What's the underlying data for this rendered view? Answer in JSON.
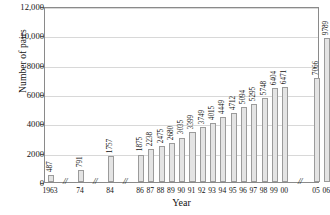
{
  "chart_data": {
    "type": "bar",
    "title": "",
    "xlabel": "Year",
    "ylabel": "Number of pairs",
    "ylim": [
      0,
      12000
    ],
    "grid": true,
    "legend": null,
    "axis_breaks": [
      "between 1963 and 74",
      "between 74 and 84",
      "between 84 and 86",
      "between 00 and 05"
    ],
    "ytick_labels": [
      "0",
      "2000",
      "4000",
      "6000",
      "8000",
      "10,000",
      "12,000"
    ],
    "ytick_values": [
      0,
      2000,
      4000,
      6000,
      8000,
      10000,
      12000
    ],
    "categories": [
      "1963",
      "74",
      "84",
      "86",
      "87",
      "88",
      "89",
      "90",
      "91",
      "92",
      "93",
      "94",
      "95",
      "96",
      "97",
      "98",
      "99",
      "00",
      "05",
      "06"
    ],
    "values": [
      487,
      791,
      1757,
      1875,
      2238,
      2475,
      2680,
      3035,
      3399,
      3749,
      4015,
      4449,
      4712,
      5094,
      5295,
      5748,
      6404,
      6471,
      7066,
      9789
    ],
    "value_labels": [
      "487",
      "791",
      "1757",
      "1875",
      "2238",
      "2475",
      "2680",
      "3035",
      "3399",
      "3749",
      "4015",
      "4449",
      "4712",
      "5094",
      "5295",
      "5748",
      "6404",
      "6471",
      "7066",
      "9789"
    ],
    "bar_color": "#e4e4e4",
    "bar_edge_color": "#9b9b9b",
    "grid_color": "#d8d8d8",
    "axis_color": "#8a8a8a"
  }
}
